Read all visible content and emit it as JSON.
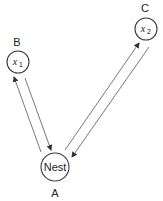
{
  "diagram": {
    "type": "foraging-route-diagram",
    "nodes": [
      {
        "id": "A",
        "label": "A",
        "text": "Nest",
        "cx": 55,
        "cy": 167,
        "r": 14
      },
      {
        "id": "B",
        "label": "B",
        "var": "x",
        "subscript": "1",
        "cx": 18,
        "cy": 62,
        "r": 11
      },
      {
        "id": "C",
        "label": "C",
        "var": "x",
        "subscript": "2",
        "cx": 146,
        "cy": 29,
        "r": 11
      }
    ],
    "edges": [
      {
        "from": "A",
        "to": "B",
        "direction": "outbound"
      },
      {
        "from": "B",
        "to": "A",
        "direction": "return"
      },
      {
        "from": "A",
        "to": "C",
        "direction": "outbound"
      },
      {
        "from": "C",
        "to": "A",
        "direction": "return"
      }
    ],
    "colors": {
      "stroke": "#3a3a3a",
      "edge": "#555555",
      "text": "#222222",
      "background": "#ffffff"
    }
  }
}
